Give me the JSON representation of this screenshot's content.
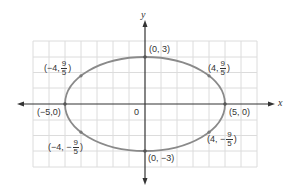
{
  "diagram": {
    "colors": {
      "grid": "#dcdcdc",
      "axis": "#333333",
      "curve": "#8a8a8a",
      "point": "#7a7a7a",
      "text": "#333333"
    },
    "axes": {
      "x_label": "x",
      "y_label": "y",
      "origin_label": "0"
    },
    "ellipse": {
      "center": [
        0,
        0
      ],
      "semi_major_a": 5,
      "semi_minor_b": 3
    },
    "points": [
      {
        "id": "top",
        "coords": [
          0,
          3
        ],
        "label": "(0, 3)"
      },
      {
        "id": "bottom",
        "coords": [
          0,
          -3
        ],
        "label": "(0, −3)"
      },
      {
        "id": "left",
        "coords": [
          -5,
          0
        ],
        "label": "(−5,0)"
      },
      {
        "id": "right",
        "coords": [
          5,
          0
        ],
        "label": "(5, 0)"
      },
      {
        "id": "upper-left",
        "coords": [
          -4,
          1.8
        ],
        "label_prefix": "(−4,",
        "frac_num": "9",
        "frac_den": "5",
        "label_suffix": ")"
      },
      {
        "id": "upper-right",
        "coords": [
          4,
          1.8
        ],
        "label_prefix": "(4,",
        "frac_num": "9",
        "frac_den": "5",
        "label_suffix": ")"
      },
      {
        "id": "lower-left",
        "coords": [
          -4,
          -1.8
        ],
        "label_prefix": "(−4, −",
        "frac_num": "9",
        "frac_den": "5",
        "label_suffix": ")"
      },
      {
        "id": "lower-right",
        "coords": [
          4,
          -1.8
        ],
        "label_prefix": "(4, −",
        "frac_num": "9",
        "frac_den": "5",
        "label_suffix": ")"
      }
    ],
    "grid": {
      "x_range": [
        -7,
        7
      ],
      "y_range": [
        -4,
        4
      ]
    }
  }
}
